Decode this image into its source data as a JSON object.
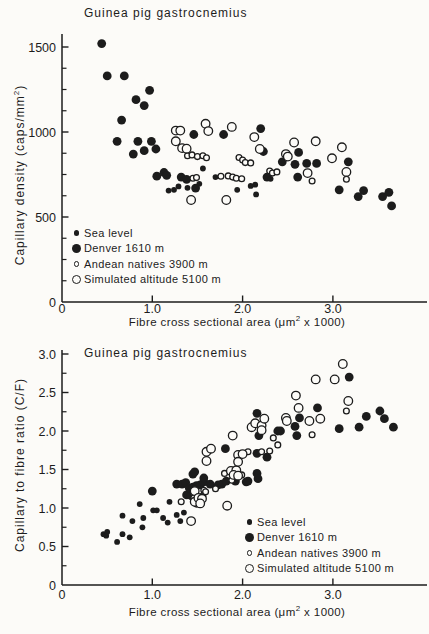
{
  "figure": {
    "ink": "#1c1c1c",
    "paper": "#fcfbf8"
  },
  "chart_data": [
    {
      "id": "capillary-density",
      "type": "scatter",
      "title": "Guinea pig gastrocnemius",
      "ylabel": {
        "pre": "Capillary density (caps/mm",
        "sup": "2",
        "post": ")"
      },
      "xlabel": {
        "pre": "Fibre cross sectional area (μm",
        "sup": "2",
        "post": " x 1000)"
      },
      "x_range": [
        0,
        4.05
      ],
      "y_range": [
        0,
        1570
      ],
      "grid": false,
      "legend_position": "lower-left-inside",
      "x_ticks": [
        {
          "v": 0,
          "label": "0",
          "tick": false
        },
        {
          "v": 1,
          "label": "1.0",
          "tick": true
        },
        {
          "v": 2,
          "label": "2.0",
          "tick": true
        },
        {
          "v": 3,
          "label": "3.0",
          "tick": true
        }
      ],
      "y_ticks": [
        {
          "v": 0,
          "label": "0"
        },
        {
          "v": 500,
          "label": "500"
        },
        {
          "v": 1000,
          "label": "1000"
        },
        {
          "v": 1500,
          "label": "1500"
        }
      ],
      "y_minor": [
        125,
        250,
        375,
        625,
        750,
        875,
        1125,
        1250,
        1375
      ],
      "series": [
        {
          "name": "Sea level",
          "marker": "filled-small",
          "points": [
            [
              1.18,
              655
            ],
            [
              1.24,
              660
            ],
            [
              1.29,
              680
            ],
            [
              1.39,
              672
            ],
            [
              1.52,
              695
            ],
            [
              1.56,
              785
            ],
            [
              1.7,
              735
            ],
            [
              1.94,
              660
            ],
            [
              2.09,
              683
            ],
            [
              2.14,
              690
            ],
            [
              2.15,
              633
            ],
            [
              2.31,
              725
            ]
          ]
        },
        {
          "name": "Denver 1610 m",
          "marker": "filled-large",
          "points": [
            [
              0.44,
              1520
            ],
            [
              0.5,
              1330
            ],
            [
              0.69,
              1330
            ],
            [
              0.66,
              1070
            ],
            [
              0.82,
              1190
            ],
            [
              0.91,
              1155
            ],
            [
              0.97,
              1245
            ],
            [
              0.61,
              945
            ],
            [
              0.84,
              945
            ],
            [
              0.99,
              945
            ],
            [
              0.79,
              870
            ],
            [
              0.91,
              890
            ],
            [
              1.04,
              900
            ],
            [
              1.05,
              740
            ],
            [
              1.13,
              762
            ],
            [
              1.16,
              745
            ],
            [
              1.32,
              735
            ],
            [
              1.38,
              722
            ],
            [
              1.46,
              985
            ],
            [
              1.48,
              670
            ],
            [
              1.79,
              985
            ],
            [
              2.2,
              1020
            ],
            [
              2.23,
              885
            ],
            [
              2.27,
              735
            ],
            [
              2.44,
              825
            ],
            [
              2.58,
              810
            ],
            [
              2.61,
              735
            ],
            [
              2.62,
              880
            ],
            [
              2.71,
              815
            ],
            [
              2.82,
              815
            ],
            [
              3.07,
              660
            ],
            [
              3.17,
              825
            ],
            [
              3.28,
              620
            ],
            [
              3.34,
              655
            ],
            [
              3.55,
              620
            ],
            [
              3.62,
              645
            ],
            [
              3.65,
              565
            ]
          ]
        },
        {
          "name": "Andean natives 3900 m",
          "marker": "open-small",
          "points": [
            [
              1.39,
              860
            ],
            [
              1.44,
              865
            ],
            [
              1.5,
              855
            ],
            [
              1.56,
              860
            ],
            [
              1.6,
              848
            ],
            [
              1.96,
              850
            ],
            [
              2.0,
              835
            ],
            [
              2.03,
              820
            ],
            [
              2.09,
              818
            ],
            [
              1.45,
              728
            ],
            [
              1.49,
              732
            ],
            [
              1.76,
              740
            ],
            [
              1.84,
              742
            ],
            [
              1.89,
              735
            ],
            [
              1.93,
              728
            ],
            [
              1.99,
              725
            ],
            [
              2.3,
              770
            ],
            [
              2.33,
              758
            ],
            [
              2.38,
              765
            ],
            [
              2.77,
              712
            ],
            [
              3.15,
              722
            ]
          ]
        },
        {
          "name": "Simulated altitude 5100 m",
          "marker": "open-large",
          "points": [
            [
              1.26,
              1008
            ],
            [
              1.31,
              1008
            ],
            [
              1.26,
              945
            ],
            [
              1.33,
              905
            ],
            [
              1.38,
              902
            ],
            [
              1.59,
              1048
            ],
            [
              1.62,
              1005
            ],
            [
              1.88,
              1030
            ],
            [
              2.13,
              970
            ],
            [
              2.19,
              900
            ],
            [
              2.48,
              870
            ],
            [
              2.5,
              855
            ],
            [
              2.57,
              938
            ],
            [
              2.72,
              758
            ],
            [
              2.81,
              945
            ],
            [
              2.99,
              845
            ],
            [
              3.1,
              910
            ],
            [
              3.15,
              765
            ],
            [
              1.43,
              600
            ],
            [
              1.82,
              600
            ]
          ]
        }
      ]
    },
    {
      "id": "capillary-fibre-ratio",
      "type": "scatter",
      "title": "Guinea pig gastrocnemius",
      "ylabel": {
        "pre": "Capillary to fibre ratio (C/F)",
        "sup": "",
        "post": ""
      },
      "xlabel": {
        "pre": "Fibre cross sectional area (μm",
        "sup": "2",
        "post": " x 1000)"
      },
      "x_range": [
        0,
        4.05
      ],
      "y_range": [
        0,
        3.05
      ],
      "grid": false,
      "legend_position": "lower-right-inside",
      "x_ticks": [
        {
          "v": 0,
          "label": "0",
          "tick": false
        },
        {
          "v": 1,
          "label": "1.0",
          "tick": true
        },
        {
          "v": 2,
          "label": "2.0",
          "tick": true
        },
        {
          "v": 3,
          "label": "3.0",
          "tick": true
        }
      ],
      "y_ticks": [
        {
          "v": 0,
          "label": "0"
        },
        {
          "v": 0.5,
          "label": "0.5"
        },
        {
          "v": 1.0,
          "label": "1.0"
        },
        {
          "v": 1.5,
          "label": "1.5"
        },
        {
          "v": 2.0,
          "label": "2.0"
        },
        {
          "v": 2.5,
          "label": "2.5"
        },
        {
          "v": 3.0,
          "label": "3.0"
        }
      ],
      "y_minor": [
        0.25,
        0.75,
        1.25,
        1.75,
        2.25,
        2.75
      ],
      "series": [
        {
          "name": "Sea level",
          "marker": "filled-small",
          "points": [
            [
              0.46,
              0.66
            ],
            [
              0.49,
              0.64
            ],
            [
              0.5,
              0.69
            ],
            [
              0.61,
              0.56
            ],
            [
              0.67,
              0.66
            ],
            [
              0.67,
              0.9
            ],
            [
              0.75,
              0.62
            ],
            [
              0.78,
              0.83
            ],
            [
              0.86,
              1.05
            ],
            [
              0.89,
              0.75
            ],
            [
              0.9,
              0.87
            ],
            [
              1.01,
              0.97
            ],
            [
              1.05,
              0.97
            ],
            [
              1.12,
              0.87
            ],
            [
              1.17,
              0.81
            ],
            [
              1.19,
              1.08
            ],
            [
              1.27,
              0.91
            ],
            [
              1.31,
              0.83
            ],
            [
              1.35,
              0.94
            ]
          ]
        },
        {
          "name": "Denver 1610 m",
          "marker": "filled-large",
          "points": [
            [
              1.0,
              1.22
            ],
            [
              1.27,
              1.31
            ],
            [
              1.33,
              1.31
            ],
            [
              1.37,
              1.33
            ],
            [
              1.38,
              1.17
            ],
            [
              1.43,
              1.16
            ],
            [
              1.41,
              1.26
            ],
            [
              1.45,
              1.27
            ],
            [
              1.45,
              1.44
            ],
            [
              1.47,
              1.47
            ],
            [
              1.49,
              1.29
            ],
            [
              1.53,
              1.3
            ],
            [
              1.57,
              1.34
            ],
            [
              1.57,
              1.39
            ],
            [
              1.64,
              1.31
            ],
            [
              1.73,
              1.3
            ],
            [
              1.77,
              1.31
            ],
            [
              1.82,
              1.35
            ],
            [
              1.92,
              1.35
            ],
            [
              2.04,
              1.34
            ],
            [
              2.06,
              1.35
            ],
            [
              2.16,
              1.45
            ],
            [
              2.17,
              1.38
            ],
            [
              2.16,
              1.71
            ],
            [
              2.27,
              1.66
            ],
            [
              1.81,
              1.77
            ],
            [
              2.16,
              2.23
            ],
            [
              2.18,
              1.94
            ],
            [
              2.39,
              2.0
            ],
            [
              2.42,
              2.0
            ],
            [
              2.58,
              2.06
            ],
            [
              2.6,
              1.94
            ],
            [
              2.63,
              2.17
            ],
            [
              2.83,
              2.3
            ],
            [
              3.07,
              2.03
            ],
            [
              3.18,
              2.7
            ],
            [
              3.29,
              2.05
            ],
            [
              3.37,
              2.19
            ],
            [
              3.52,
              2.26
            ],
            [
              3.57,
              2.16
            ],
            [
              3.67,
              2.05
            ]
          ]
        },
        {
          "name": "Andean natives 3900 m",
          "marker": "open-small",
          "points": [
            [
              1.32,
              1.08
            ],
            [
              1.46,
              1.13
            ],
            [
              1.5,
              1.1
            ],
            [
              1.53,
              1.08
            ],
            [
              1.49,
              1.05
            ],
            [
              1.56,
              1.16
            ],
            [
              1.57,
              1.23
            ],
            [
              1.59,
              1.21
            ],
            [
              1.7,
              1.25
            ],
            [
              1.8,
              1.45
            ],
            [
              1.88,
              1.36
            ],
            [
              1.99,
              1.43
            ],
            [
              2.06,
              1.73
            ],
            [
              2.21,
              1.73
            ],
            [
              2.3,
              1.74
            ],
            [
              2.34,
              1.91
            ],
            [
              2.39,
              1.82
            ],
            [
              2.77,
              1.95
            ],
            [
              3.15,
              2.26
            ]
          ]
        },
        {
          "name": "Simulated altitude 5100 m",
          "marker": "open-large",
          "points": [
            [
              1.43,
              0.83
            ],
            [
              1.47,
              1.22
            ],
            [
              1.47,
              1.08
            ],
            [
              1.51,
              1.13
            ],
            [
              1.55,
              1.12
            ],
            [
              1.53,
              1.06
            ],
            [
              1.6,
              1.73
            ],
            [
              1.65,
              1.77
            ],
            [
              1.6,
              1.61
            ],
            [
              1.83,
              1.03
            ],
            [
              1.87,
              1.48
            ],
            [
              1.93,
              1.49
            ],
            [
              1.9,
              1.43
            ],
            [
              1.95,
              1.42
            ],
            [
              1.95,
              1.69
            ],
            [
              2.0,
              1.7
            ],
            [
              1.95,
              1.6
            ],
            [
              1.89,
              1.94
            ],
            [
              2.1,
              2.05
            ],
            [
              2.14,
              2.1
            ],
            [
              2.21,
              2.07
            ],
            [
              2.21,
              2.01
            ],
            [
              2.24,
              2.16
            ],
            [
              2.48,
              2.17
            ],
            [
              2.49,
              2.13
            ],
            [
              2.74,
              2.13
            ],
            [
              2.86,
              2.16
            ],
            [
              2.59,
              2.46
            ],
            [
              2.62,
              2.3
            ],
            [
              2.81,
              2.67
            ],
            [
              3.02,
              2.67
            ],
            [
              3.11,
              2.87
            ],
            [
              3.17,
              2.39
            ]
          ]
        }
      ]
    }
  ]
}
